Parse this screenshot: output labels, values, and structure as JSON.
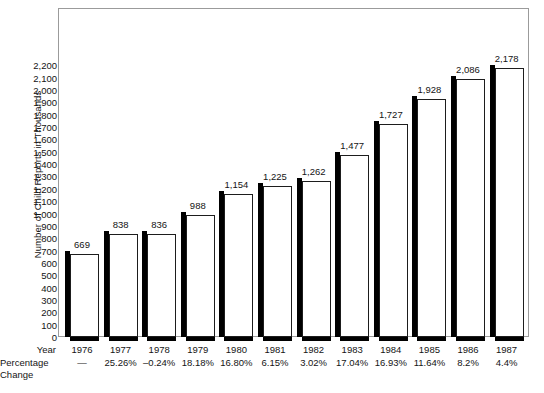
{
  "chart_data": {
    "type": "bar",
    "title": "",
    "xlabel": "Year",
    "ylabel": "Number of Child Reports in Thousands",
    "ylim": [
      0,
      2200
    ],
    "grid": false,
    "legend": "none",
    "categories": [
      "1976",
      "1977",
      "1978",
      "1979",
      "1980",
      "1981",
      "1982",
      "1983",
      "1984",
      "1985",
      "1986",
      "1987"
    ],
    "values": [
      669,
      838,
      836,
      988,
      1154,
      1225,
      1262,
      1477,
      1727,
      1928,
      2086,
      2178
    ],
    "value_labels": [
      "669",
      "838",
      "836",
      "988",
      "1,154",
      "1,225",
      "1,262",
      "1,477",
      "1,727",
      "1,928",
      "2,086",
      "2,178"
    ],
    "yticks": [
      0,
      100,
      200,
      300,
      400,
      500,
      600,
      700,
      800,
      900,
      1000,
      1100,
      1200,
      1300,
      1400,
      1500,
      1600,
      1700,
      1800,
      1900,
      2000,
      2100,
      2200
    ],
    "ytick_labels": [
      "0",
      "100",
      "200",
      "300",
      "400",
      "500",
      "600",
      "700",
      "800",
      "900",
      "1,000",
      "1,100",
      "1,200",
      "1,300",
      "1,400",
      "1,500",
      "1,600",
      "1,700",
      "1,800",
      "1,900",
      "2,000",
      "2,100",
      "2,200"
    ],
    "annotations": {
      "percentage_change": [
        "—",
        "25.26%",
        "–0.24%",
        "18.18%",
        "16.80%",
        "6.15%",
        "3.02%",
        "17.04%",
        "16.93%",
        "11.64%",
        "8.2%",
        "4.4%"
      ]
    }
  },
  "axes": {
    "y_title": "Number of Child Reports in Thousands"
  },
  "table": {
    "year_row_label": "Year",
    "percentage_row_label_line1": "Percentage",
    "percentage_row_label_line2": "Change"
  },
  "colors": {
    "bar_face": "#ffffff",
    "bar_outline": "#1d1d1d",
    "bar_shadow": "#000000",
    "frame": "#9b9b9b",
    "text": "#141414",
    "background": "#ffffff"
  }
}
